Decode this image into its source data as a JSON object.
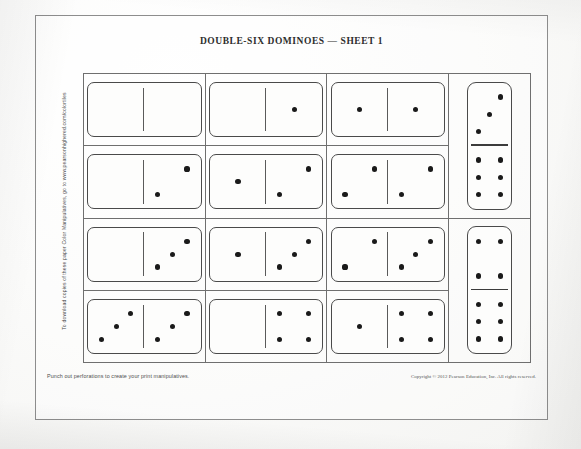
{
  "page": {
    "title": "DOUBLE-SIX DOMINOES — SHEET 1",
    "side_note": "To download copies of these paper Color Manipulatives, go to www.pearsonhighered.com/colortiles",
    "punch_note": "Punch out perforations to create your print manipulatives.",
    "copyright": "Copyright © 2012 Pearson Education, Inc.  All rights reserved.",
    "colors": {
      "paper": "#fdfdfc",
      "ink": "#1a1a1a",
      "rule": "#6f6f6f",
      "tile_border": "#4a4a4a"
    }
  },
  "grid": {
    "columns": 3,
    "rows": 4,
    "orientation": "horizontal",
    "tiles": [
      [
        {
          "left": 0,
          "right": 0
        },
        {
          "left": 0,
          "right": 1
        },
        {
          "left": 1,
          "right": 1
        }
      ],
      [
        {
          "left": 0,
          "right": 2
        },
        {
          "left": 1,
          "right": 2
        },
        {
          "left": 2,
          "right": 2
        }
      ],
      [
        {
          "left": 0,
          "right": 3
        },
        {
          "left": 1,
          "right": 3
        },
        {
          "left": 2,
          "right": 3
        }
      ],
      [
        {
          "left": 3,
          "right": 3
        },
        {
          "left": 0,
          "right": 4
        },
        {
          "left": 1,
          "right": 4
        }
      ]
    ]
  },
  "side_column": {
    "orientation": "vertical",
    "tiles": [
      {
        "top": 3,
        "bottom": 6
      },
      {
        "top": 4,
        "bottom": 6
      }
    ]
  },
  "pip_patterns": {
    "0": [],
    "1": [
      5
    ],
    "2": [
      3,
      7
    ],
    "3": [
      3,
      5,
      7
    ],
    "4": [
      1,
      3,
      7,
      9
    ],
    "5": [
      1,
      3,
      5,
      7,
      9
    ],
    "6": [
      1,
      3,
      4,
      6,
      7,
      9
    ]
  }
}
